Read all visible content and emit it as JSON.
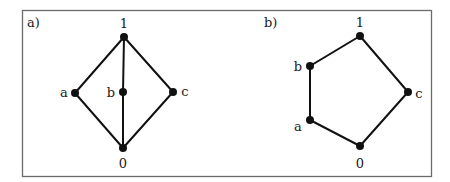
{
  "figure": {
    "panels": [
      {
        "label": "a)",
        "nodes": [
          {
            "id": "1",
            "label": "1"
          },
          {
            "id": "a",
            "label": "a"
          },
          {
            "id": "b",
            "label": "b"
          },
          {
            "id": "c",
            "label": "c"
          },
          {
            "id": "0",
            "label": "0"
          }
        ],
        "edges": [
          [
            "1",
            "a"
          ],
          [
            "1",
            "b"
          ],
          [
            "1",
            "c"
          ],
          [
            "a",
            "0"
          ],
          [
            "b",
            "0"
          ],
          [
            "c",
            "0"
          ]
        ]
      },
      {
        "label": "b)",
        "nodes": [
          {
            "id": "1",
            "label": "1"
          },
          {
            "id": "b",
            "label": "b"
          },
          {
            "id": "a",
            "label": "a"
          },
          {
            "id": "c",
            "label": "c"
          },
          {
            "id": "0",
            "label": "0"
          }
        ],
        "edges": [
          [
            "1",
            "b"
          ],
          [
            "b",
            "a"
          ],
          [
            "a",
            "0"
          ],
          [
            "1",
            "c"
          ],
          [
            "c",
            "0"
          ]
        ]
      }
    ],
    "colors": {
      "frame": "#6b6b6b",
      "ink": "#111111"
    }
  }
}
